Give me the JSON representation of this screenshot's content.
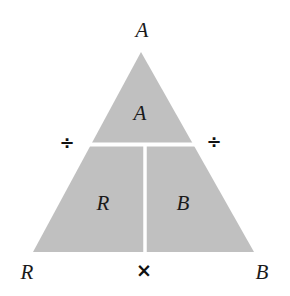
{
  "figure": {
    "background_color": "#ffffff",
    "triangle_fill": "#c0c0c0",
    "divider_color": "#ffffff",
    "text_color": "#1a1a1a"
  },
  "vertex_labels": {
    "top": "A",
    "bottom_left": "R",
    "bottom_right": "B"
  },
  "region_labels": {
    "top": "A",
    "bottom_left": "R",
    "bottom_right": "B"
  },
  "operators": {
    "left_divide": "÷",
    "right_divide": "÷",
    "bottom_multiply": "×"
  },
  "geometry": {
    "apex": [
      141,
      52
    ],
    "bottom_left": [
      33,
      252
    ],
    "bottom_right": [
      254,
      252
    ],
    "horizontal_divider_y": 144,
    "vertical_divider_x": 145
  }
}
